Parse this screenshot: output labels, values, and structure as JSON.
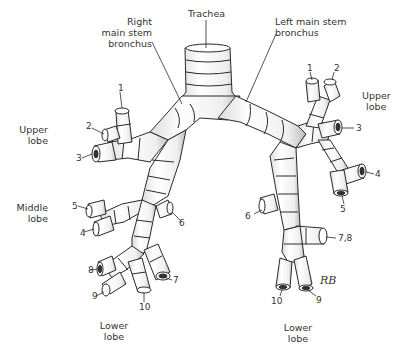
{
  "figure": {
    "type": "anatomical-diagram"
  },
  "labels": {
    "trachea": "Trachea",
    "right_main": [
      "Right",
      "main stem",
      "bronchus"
    ],
    "left_main": [
      "Left main stem",
      "bronchus"
    ],
    "right_upper": [
      "Upper",
      "lobe"
    ],
    "right_middle": [
      "Middle",
      "lobe"
    ],
    "right_lower": [
      "Lower",
      "lobe"
    ],
    "left_upper": [
      "Upper",
      "lobe"
    ],
    "left_lower": [
      "Lower",
      "lobe"
    ],
    "signature": "RB"
  },
  "segments": {
    "right": [
      "1",
      "2",
      "3",
      "4",
      "5",
      "6",
      "7",
      "8",
      "9",
      "10"
    ],
    "left": [
      "1",
      "2",
      "3",
      "4",
      "5",
      "6",
      "7,8",
      "9",
      "10"
    ]
  },
  "colors": {
    "line": "#2a2a2a",
    "fill": "#ffffff",
    "shade": "#d9d9d9"
  }
}
